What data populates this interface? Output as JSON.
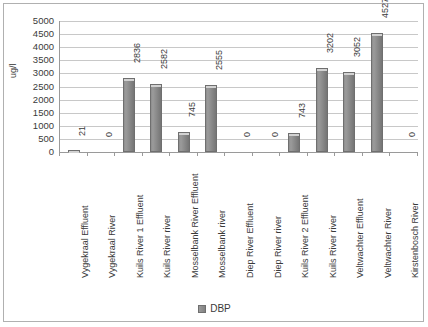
{
  "chart_data": {
    "type": "bar",
    "title": "",
    "xlabel": "",
    "ylabel": "ug/l",
    "ylim": [
      0,
      5000
    ],
    "ytick_step": 500,
    "yticks": [
      5000,
      4500,
      4000,
      3500,
      3000,
      2500,
      2000,
      1500,
      1000,
      500,
      0
    ],
    "grid": true,
    "legend_position": "bottom",
    "categories": [
      "Vygekraal Effluent",
      "Vygekraal River",
      "Kuils River 1 Effluent",
      "Kuils River river",
      "Mosselbank River Effluent",
      "Mosselbank river",
      "Diep River Effluent",
      "Diep River river",
      "Kuils River 2 Effluent",
      "Kuils River river",
      "Veltwachter Effluent",
      "Veltwachter River",
      "Kirstenbosch River"
    ],
    "series": [
      {
        "name": "DBP",
        "color": "#808080",
        "values": [
          21,
          0,
          2836,
          2582,
          745,
          2555,
          0,
          0,
          743,
          3202,
          3052,
          4527,
          0
        ]
      }
    ],
    "data_labels": [
      "21",
      "0",
      "2836",
      "2582",
      "745",
      "2555",
      "0",
      "0",
      "743",
      "3202",
      "3052",
      "4527",
      "0"
    ]
  },
  "legend": {
    "entries": [
      {
        "label": "DBP",
        "color": "#808080"
      }
    ]
  },
  "axis": {
    "y_title": "ug/l"
  }
}
